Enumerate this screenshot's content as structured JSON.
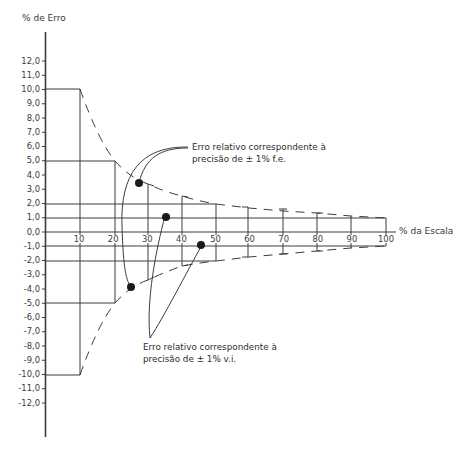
{
  "chart_data": {
    "type": "line",
    "title": "",
    "xlabel": "% da Escala",
    "ylabel": "% de Erro",
    "xlim": [
      0,
      100
    ],
    "ylim": [
      -12,
      12
    ],
    "x_ticks": [
      "10",
      "20",
      "30",
      "40",
      "50",
      "60",
      "70",
      "80",
      "90",
      "100"
    ],
    "y_ticks": [
      "12,0",
      "11,0",
      "10,0",
      "9,0",
      "8,0",
      "7,0",
      "6,0",
      "5,0",
      "4,0",
      "3,0",
      "2,0",
      "1,0",
      "0,0",
      "-1,0",
      "-2,0",
      "-3,0",
      "-4,0",
      "-5,0",
      "-6,0",
      "-7,0",
      "-8,0",
      "-9,0",
      "-10,0",
      "-11,0",
      "-12,0"
    ],
    "grid": false,
    "series": [
      {
        "name": "Erro relativo correspondente à precisão de ± 1% f.e.",
        "style": "dashed",
        "x": [
          10,
          20,
          30,
          40,
          50,
          60,
          70,
          80,
          90,
          100
        ],
        "upper": [
          10.0,
          5.0,
          3.33,
          2.5,
          2.0,
          1.67,
          1.43,
          1.25,
          1.11,
          1.0
        ],
        "lower": [
          -10.0,
          -5.0,
          -3.33,
          -2.5,
          -2.0,
          -1.67,
          -1.43,
          -1.25,
          -1.11,
          -1.0
        ]
      },
      {
        "name": "Erro relativo correspondente à precisão de ± 1% v.i.",
        "style": "solid",
        "x": [
          0,
          100
        ],
        "upper": [
          1.0,
          1.0
        ],
        "lower": [
          -1.0,
          -1.0
        ]
      }
    ],
    "reference_lines": [
      {
        "y": 10.0,
        "x_range": [
          0,
          10
        ]
      },
      {
        "y": 5.0,
        "x_range": [
          0,
          20
        ]
      },
      {
        "y": 2.0,
        "x_range": [
          0,
          50
        ]
      },
      {
        "y": 1.0,
        "x_range": [
          0,
          100
        ]
      },
      {
        "y": -1.0,
        "x_range": [
          0,
          100
        ]
      },
      {
        "y": -2.0,
        "x_range": [
          0,
          50
        ]
      },
      {
        "y": -5.0,
        "x_range": [
          0,
          20
        ]
      },
      {
        "y": -10.0,
        "x_range": [
          0,
          10
        ]
      }
    ],
    "annotations": [
      {
        "text_line1": "Erro relativo correspondente à",
        "text_line2": "precisão de ± 1% f.e.",
        "points": [
          [
            27,
            3.4
          ],
          [
            24,
            -3.8
          ]
        ]
      },
      {
        "text_line1": "Erro relativo correspondente à",
        "text_line2": "precisão de ± 1% v.i.",
        "points": [
          [
            35,
            1.1
          ],
          [
            46,
            -1.0
          ]
        ]
      }
    ]
  },
  "axes": {
    "ylabel": "% de Erro",
    "xlabel": "% da Escala"
  },
  "annotations": {
    "fe": {
      "line1": "Erro relativo correspondente à",
      "line2": "precisão de ± 1% f.e."
    },
    "vi": {
      "line1": "Erro relativo correspondente à",
      "line2": "precisão de ± 1% v.i."
    }
  },
  "colors": {
    "line": "#3c3c3c",
    "text": "#3a3a3a",
    "marker": "#1a1a1a"
  }
}
